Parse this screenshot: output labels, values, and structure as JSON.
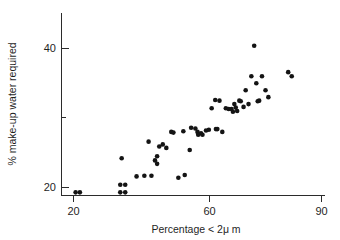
{
  "figure": {
    "background_color": "#ffffff",
    "point_color": "#141414",
    "axis_color": "#2b2b2b"
  },
  "chart_data": {
    "type": "scatter",
    "title": "",
    "subtitle": "",
    "xlabel": "Percentage < 2μ m",
    "ylabel": "% make-up water required",
    "xlim": [
      17,
      93
    ],
    "ylim": [
      18.2,
      42.5
    ],
    "xticks": [
      20,
      60,
      90
    ],
    "xtick_labels": [
      "20",
      "60",
      "90"
    ],
    "yticks": [
      20,
      40
    ],
    "ytick_labels": [
      "20",
      "40"
    ],
    "yticks_minor": [
      30
    ],
    "grid": false,
    "legend": null,
    "annotations": [],
    "series": [
      {
        "name": "observations",
        "marker": "filled-circle",
        "color": "#141414",
        "x": [
          20.6,
          21.8,
          33.2,
          33.2,
          34.6,
          34.6,
          33.6,
          37.8,
          40.0,
          41.2,
          42.0,
          43.0,
          43.6,
          43.6,
          44.2,
          45.2,
          46.2,
          47.6,
          48.2,
          49.6,
          51.0,
          51.4,
          52.8,
          53.2,
          54.4,
          55.0,
          55.2,
          56.0,
          56.4,
          57.4,
          58.2,
          59.0,
          60.0,
          60.2,
          60.6,
          61.2,
          62.0,
          63.0,
          63.8,
          64.6,
          65.0,
          65.4,
          65.8,
          66.2,
          66.8,
          67.2,
          68.0,
          68.6,
          69.4,
          70.2,
          71.0,
          71.6,
          72.0,
          72.4,
          73.2,
          74.2,
          75.0,
          80.6,
          81.6
        ],
        "y": [
          19.3,
          19.3,
          19.3,
          20.4,
          19.3,
          20.4,
          24.2,
          21.6,
          21.7,
          26.6,
          21.7,
          23.9,
          24.5,
          23.4,
          25.9,
          26.2,
          25.7,
          28.0,
          27.9,
          21.4,
          28.1,
          21.8,
          25.4,
          28.6,
          28.5,
          28.0,
          27.6,
          27.8,
          27.6,
          28.2,
          28.3,
          31.4,
          32.6,
          28.4,
          28.4,
          32.5,
          28.0,
          31.4,
          31.3,
          31.3,
          30.9,
          32.0,
          31.5,
          31.0,
          32.5,
          32.4,
          31.6,
          34.0,
          32.0,
          36.0,
          40.4,
          35.0,
          32.4,
          32.5,
          36.0,
          34.0,
          33.0,
          36.6,
          36.0
        ]
      }
    ]
  }
}
